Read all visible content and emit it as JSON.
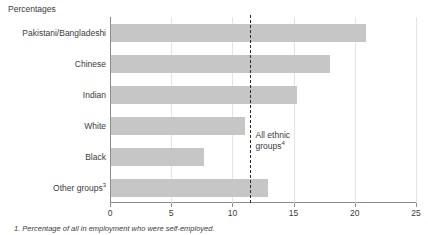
{
  "axis_title": "Percentages",
  "footnote": "1. Percentage of all in employment who were self-employed.",
  "annotation": {
    "line1": "All ethnic",
    "line2": "groups",
    "marker": "4"
  },
  "colors": {
    "bar_fill": "#c6c6c6",
    "axis": "#8d8d8d",
    "grid": "#e4e4e4",
    "ref_line": "#2b2b2b",
    "text": "#3b3b3b",
    "background": "#ffffff"
  },
  "chart_data": {
    "type": "bar",
    "orientation": "horizontal",
    "title": "",
    "subtitle": "",
    "xlabel": "Percentages",
    "ylabel": "",
    "xlim": [
      0,
      25
    ],
    "ticks": [
      0,
      5,
      10,
      15,
      20,
      25
    ],
    "tick_labels": [
      "0",
      "5",
      "10",
      "15",
      "20",
      "25"
    ],
    "grid": true,
    "legend": false,
    "categories": [
      "Pakistani/Bangladeshi",
      "Chinese",
      "Indian",
      "White",
      "Black",
      "Other groups"
    ],
    "category_markers": [
      "",
      "",
      "",
      "",
      "",
      "3"
    ],
    "values": [
      20.9,
      18.0,
      15.3,
      11.0,
      7.7,
      12.9
    ],
    "reference_line": {
      "label": "All ethnic groups",
      "marker": "4",
      "value": 11.4,
      "style": "dashed"
    }
  }
}
